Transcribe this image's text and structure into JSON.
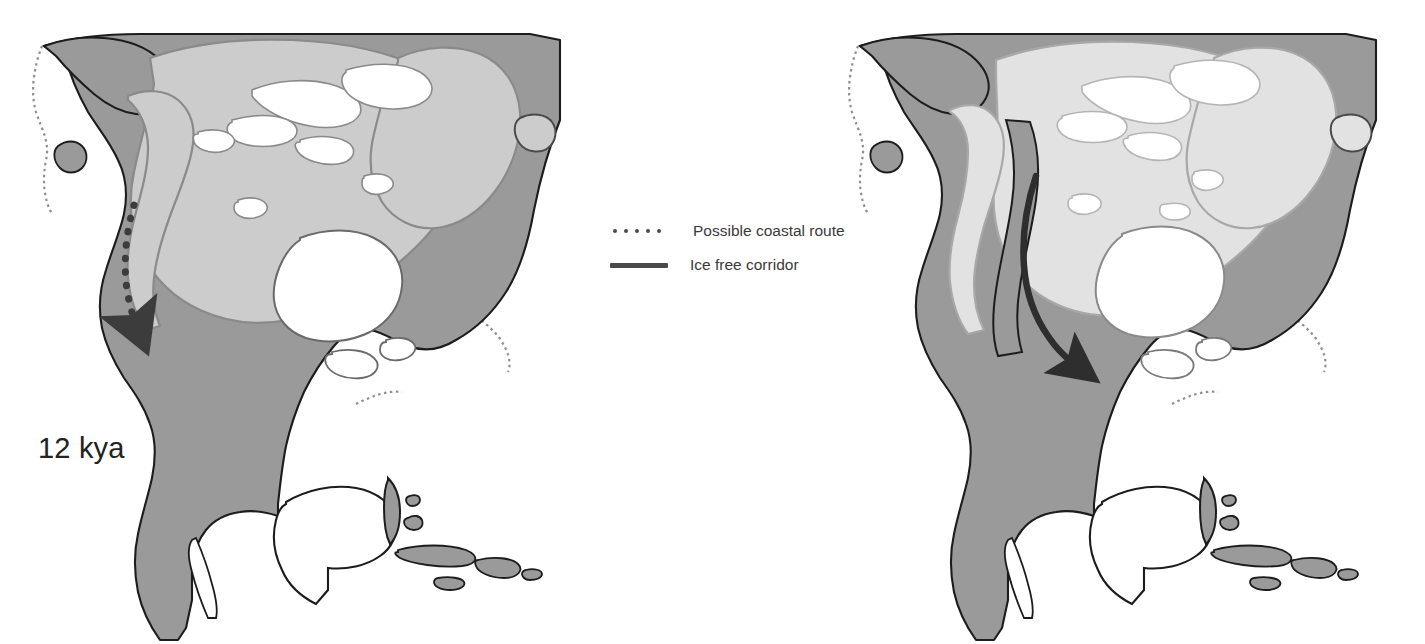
{
  "figure": {
    "type": "map-figure",
    "background_color": "#ffffff"
  },
  "panels": [
    {
      "id": "left",
      "era_label": "12 kya",
      "route_shown": "Possible coastal route",
      "route_style": "dotted",
      "ice_fill": "#cccccc",
      "land_fill": "#9a9a9a",
      "water_fill": "#ffffff"
    },
    {
      "id": "right",
      "era_label": "11.5 kya",
      "route_shown": "Ice free corridor",
      "route_style": "solid",
      "ice_fill": "#e2e2e2",
      "land_fill": "#9a9a9a",
      "water_fill": "#ffffff"
    }
  ],
  "legend": {
    "items": [
      {
        "label": "Possible coastal route",
        "marker": "dotted-line",
        "color": "#4a4a4a"
      },
      {
        "label": "Ice free corridor",
        "marker": "solid-line",
        "color": "#4a4a4a"
      }
    ]
  },
  "colors": {
    "land": "#9a9a9a",
    "ice_full": "#cccccc",
    "ice_retreated": "#e2e2e2",
    "water": "#ffffff",
    "outline": "#1c1c1c",
    "ice_outline": "#8a8a8a",
    "route": "#4a4a4a",
    "label_text": "#222222",
    "legend_text": "#3a3a3a"
  }
}
